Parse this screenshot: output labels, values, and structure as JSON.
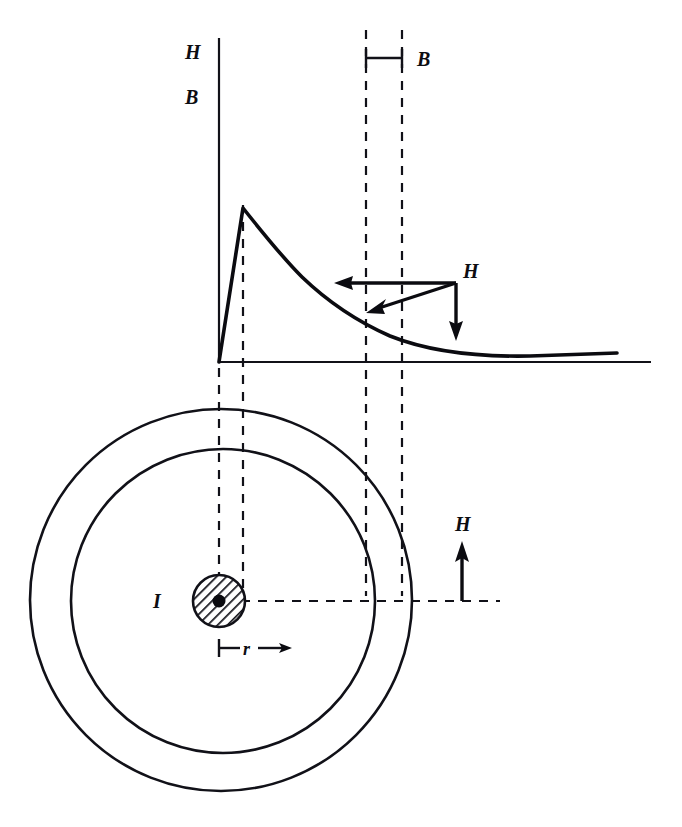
{
  "figure": {
    "background_color": "#ffffff",
    "ink_color": "#111118"
  },
  "upper_plot": {
    "vertical_axis_labels": [
      {
        "text": "H",
        "x": 192,
        "y": 59
      },
      {
        "text": "B",
        "x": 192,
        "y": 104
      }
    ],
    "axis": {
      "vertical": {
        "x": 219,
        "y_top": 38,
        "y_bottom": 362
      },
      "horizontal": {
        "y": 362,
        "x_left": 219,
        "x_right": 651
      }
    },
    "curve": {
      "description": "linear rise inside wire then 1/r decay outside",
      "peak": {
        "x": 243,
        "y": 208
      },
      "origin": {
        "x": 219,
        "y": 362
      },
      "tail_end": {
        "x": 617,
        "y": 353
      }
    },
    "b_dimension": {
      "label": "B",
      "label_x": 425,
      "label_y": 66,
      "bar_y": 58,
      "x_start": 366,
      "x_end": 402
    },
    "h_vector": {
      "label": "H",
      "label_x": 470,
      "label_y": 278,
      "apex": {
        "x": 456,
        "y": 283
      },
      "horizontal_arrow_tip": {
        "x": 337,
        "y": 283
      },
      "diagonal_arrow_tip": {
        "x": 369,
        "y": 312
      },
      "vertical_arrow_tip": {
        "x": 456,
        "y": 338
      }
    }
  },
  "lower_diagram": {
    "outer_circle": {
      "cx": 221,
      "cy": 600,
      "r": 191
    },
    "inner_circle": {
      "cx": 223,
      "cy": 601,
      "r": 152
    },
    "wire": {
      "label": "I",
      "label_x": 160,
      "label_y": 607,
      "cx": 219,
      "cy": 601,
      "r": 26,
      "core_dot_r": 6,
      "hatched": true
    },
    "radius_dimension": {
      "label": "r",
      "label_x": 246,
      "label_y": 655,
      "tick_x": 219,
      "tick_y": 648,
      "arrow_tip_x": 288
    },
    "h_arrow": {
      "label": "H",
      "label_x": 462,
      "label_y": 531,
      "base": {
        "x": 462,
        "y": 601
      },
      "tip": {
        "x": 462,
        "y": 545
      }
    },
    "horizontal_dashed": {
      "y": 601,
      "x_start": 241,
      "x_end": 500
    }
  },
  "dashed_guides": {
    "vertical_lines": [
      {
        "name": "wire-center-guide",
        "x": 219,
        "y_top": 368,
        "y_bottom": 596
      },
      {
        "name": "wire-surface-guide",
        "x": 243,
        "y_top": 205,
        "y_bottom": 596
      },
      {
        "name": "inner-circle-guide",
        "x": 366,
        "y_top": 30,
        "y_bottom": 596
      },
      {
        "name": "outer-circle-guide",
        "x": 402,
        "y_top": 30,
        "y_bottom": 596
      }
    ]
  }
}
